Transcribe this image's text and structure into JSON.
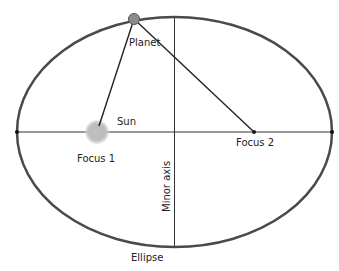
{
  "diagram": {
    "colors": {
      "ellipse_stroke": "#4a4a4a",
      "axis_stroke": "#333333",
      "planet_fill": "#8c8c8c",
      "planet_stroke": "#555555",
      "sun_fill": "#b8b8b8",
      "label": "#222222"
    },
    "labels": {
      "planet": "Planet",
      "sun": "Sun",
      "focus1": "Focus 1",
      "focus2": "Focus 2",
      "minor_axis": "Minor axis",
      "ellipse": "Ellipse"
    },
    "geometry": {
      "ellipse_center": [
        174.5,
        132
      ],
      "ellipse_rx": 157.5,
      "ellipse_ry": 115,
      "focus1": [
        97,
        132
      ],
      "focus2": [
        254,
        132
      ],
      "planet": [
        134,
        19
      ]
    }
  }
}
